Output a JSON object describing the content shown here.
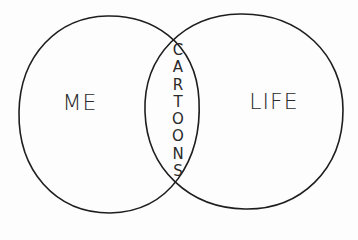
{
  "diagram": {
    "type": "venn",
    "stroke_color": "#1e1e1e",
    "background_color": "#fdfdfd",
    "sets": [
      {
        "id": "me",
        "label": "ME"
      },
      {
        "id": "life",
        "label": "LIFE"
      }
    ],
    "intersection": {
      "sets": [
        "me",
        "life"
      ],
      "label": "CARTOONS",
      "orientation": "vertical"
    }
  }
}
